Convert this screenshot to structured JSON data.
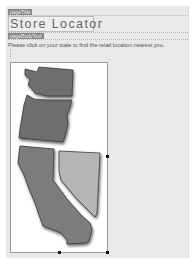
{
  "regions": {
    "title_tag": "pageTitle",
    "body_tag": "pageBodyText"
  },
  "page": {
    "title": "Store Locator",
    "instruction": "Please click on your state to find the retail location nearest you."
  },
  "map": {
    "states": [
      {
        "name": "Washington",
        "color": "#6e6e6e"
      },
      {
        "name": "Oregon",
        "color": "#6e6e6e"
      },
      {
        "name": "California",
        "color": "#7c7c7c"
      },
      {
        "name": "Nevada",
        "color": "#b5b5b5"
      }
    ]
  },
  "colors": {
    "canvas_bg": "#e9e9e9",
    "tag_bg": "#8a8a8a",
    "state_stroke": "#3a3a3a"
  }
}
